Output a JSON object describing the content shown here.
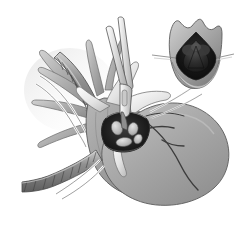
{
  "figure": {
    "title": "Surgical illustration: heart with atriotomy and instrument, valve inset",
    "domain_note": "grayscale line-and-tone medical illustration",
    "width": 242,
    "height": 226,
    "background_color": "#ffffff",
    "palette": {
      "background": "#ffffff",
      "tissue_light": "#d8d8d8",
      "tissue_mid": "#a8a8a8",
      "tissue_mid_dark": "#8e8e8e",
      "tissue_dark": "#6f6f6f",
      "cavity_dark": "#2a2a2a",
      "cavity_black": "#131313",
      "outline": "#3d3d3d",
      "outline_soft": "#6a6a6a",
      "instrument_light": "#e6e6e6",
      "instrument_mid": "#bdbdbd",
      "suture_white": "#f4f4f4",
      "vessel_dark": "#404040",
      "leaflet_light": "#cfcfcf",
      "leaflet_mid": "#9a9a9a"
    }
  },
  "main_view": {
    "name": "heart-main-view",
    "parts": [
      {
        "id": "ventricular-mass",
        "label": "Ventricular mass",
        "tone": "#a3a3a3"
      },
      {
        "id": "atrial-wall",
        "label": "Right atrial wall",
        "tone": "#9e9e9e"
      },
      {
        "id": "atriotomy-opening",
        "label": "Atriotomy opening",
        "tone": "#1d1d1d"
      },
      {
        "id": "valve-leaflets",
        "label": "Valve leaflets seen through atriotomy",
        "tone": "#c8c8c8"
      },
      {
        "id": "retracted-flap-upper",
        "label": "Retracted atrial flap, upper",
        "tone": "#efefef"
      },
      {
        "id": "retracted-flap-right",
        "label": "Retracted atrial flap, right",
        "tone": "#e8e8e8"
      },
      {
        "id": "coronary-vessels",
        "label": "Coronary vessels",
        "tone": "#3f3f3f"
      },
      {
        "id": "great-vessel-stumps",
        "label": "Great vessel stumps",
        "tone": "#b0b0b0"
      }
    ]
  },
  "instruments": {
    "name": "surgical-instruments",
    "items": [
      {
        "id": "forceps",
        "label": "Forceps / clamp inserted through atriotomy",
        "tone": "#dcdcdc"
      },
      {
        "id": "cannula-superior",
        "label": "Superior vena cava cannula",
        "tone": "#8a8a8a"
      },
      {
        "id": "cannula-inferior",
        "label": "Inferior vena cava cannula",
        "tone": "#8a8a8a"
      },
      {
        "id": "snare-tape-superior",
        "label": "Snare tape, superior",
        "tone": "#f2f2f2"
      },
      {
        "id": "snare-tape-inferior",
        "label": "Snare tape, inferior",
        "tone": "#f2f2f2"
      },
      {
        "id": "stay-suture-right",
        "label": "Stay suture, right",
        "tone": "#efefef"
      }
    ]
  },
  "inset_view": {
    "name": "valve-detail-inset",
    "label": "Detail: valve viewed through retracted atriotomy",
    "parts": [
      {
        "id": "inset-flaps",
        "label": "Retracted tissue flaps",
        "tone": "#9d9d9d"
      },
      {
        "id": "inset-cavity",
        "label": "Atrial cavity",
        "tone": "#141414"
      },
      {
        "id": "inset-valve",
        "label": "Tricuspid valve, three leaflets",
        "tone": "#2e2e2e"
      },
      {
        "id": "inset-suture-left",
        "label": "Traction suture, left",
        "tone": "#8f8f8f"
      },
      {
        "id": "inset-suture-right",
        "label": "Traction suture, right",
        "tone": "#8f8f8f"
      }
    ]
  }
}
